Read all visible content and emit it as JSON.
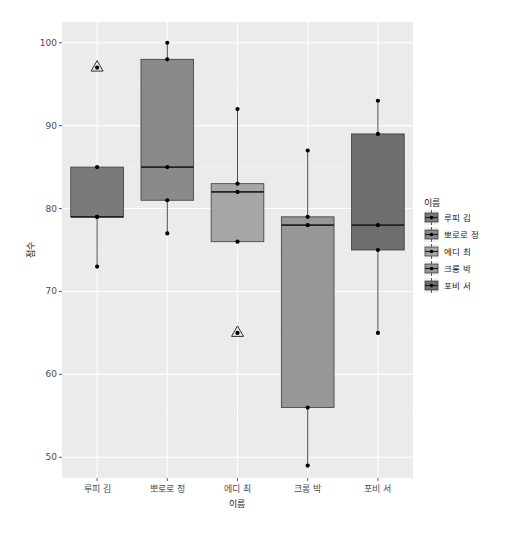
{
  "chart_data": {
    "type": "boxplot",
    "title": "",
    "xlabel": "이름",
    "ylabel": "점수",
    "ylim": [
      47.5,
      102.5
    ],
    "yticks": [
      50,
      60,
      70,
      80,
      90,
      100
    ],
    "grid": true,
    "legend_position": "right",
    "legend_title": "이름",
    "categories": [
      "루피 김",
      "뽀로로 정",
      "에디 최",
      "크롱 박",
      "포비 서"
    ],
    "series": [
      {
        "name": "루피 김",
        "fill": "#7a7a7a",
        "min": 73,
        "q1": 79,
        "median": 79,
        "q3": 85,
        "max": 85,
        "outliers": [
          97
        ],
        "points": [
          73,
          79,
          79,
          85,
          97
        ]
      },
      {
        "name": "뽀로로 정",
        "fill": "#8a8a8a",
        "min": 77,
        "q1": 81,
        "median": 85,
        "q3": 98,
        "max": 100,
        "outliers": [],
        "points": [
          77,
          81,
          85,
          98,
          100
        ]
      },
      {
        "name": "에디 최",
        "fill": "#a6a6a6",
        "min": 76,
        "q1": 76,
        "median": 82,
        "q3": 83,
        "max": 92,
        "outliers": [
          65
        ],
        "points": [
          65,
          76,
          82,
          83,
          92
        ]
      },
      {
        "name": "크롱 박",
        "fill": "#979797",
        "min": 49,
        "q1": 56,
        "median": 78,
        "q3": 79,
        "max": 87,
        "outliers": [],
        "points": [
          49,
          56,
          78,
          79,
          87
        ]
      },
      {
        "name": "포비 서",
        "fill": "#6e6e6e",
        "min": 65,
        "q1": 75,
        "median": 78,
        "q3": 89,
        "max": 93,
        "outliers": [],
        "points": [
          65,
          75,
          78,
          89,
          93
        ]
      }
    ]
  },
  "colors": {
    "panel_bg": "#ebebeb",
    "grid_major": "#ffffff",
    "grid_minor": "#f4f4f4",
    "box_outline": "#3a3a3a",
    "point": "#000000"
  }
}
